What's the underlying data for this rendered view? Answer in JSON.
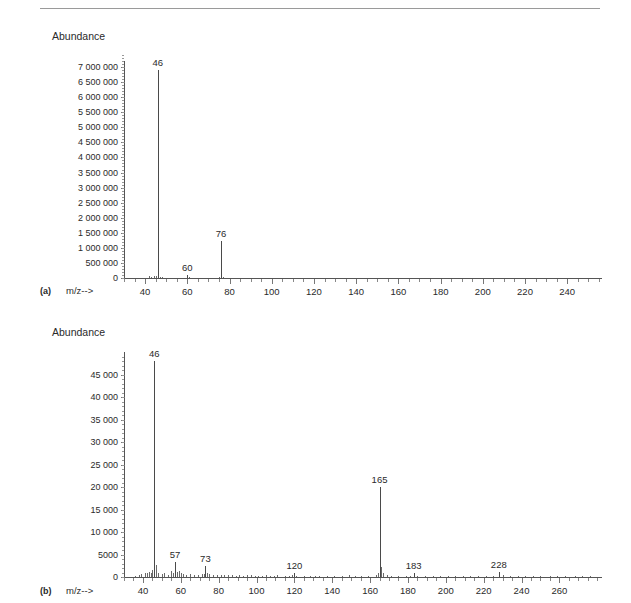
{
  "page": {
    "header_rule": true,
    "cropped_header_text": ""
  },
  "panels": [
    {
      "id": "a",
      "letter": "(a)",
      "y_axis_title": "Abundance",
      "x_axis_title": "m/z-->"
    },
    {
      "id": "b",
      "letter": "(b)",
      "y_axis_title": "Abundance",
      "x_axis_title": "m/z-->"
    }
  ],
  "chart_data": [
    {
      "type": "bar",
      "id": "spectrum-a",
      "title": "",
      "subtitle": "(a)",
      "xlabel": "m/z-->",
      "ylabel": "Abundance",
      "xlim": [
        30,
        256
      ],
      "ylim": [
        0,
        7200000
      ],
      "xticks": [
        40,
        60,
        80,
        100,
        120,
        140,
        160,
        180,
        200,
        220,
        240
      ],
      "xtick_minor_step": 5,
      "yticks": [
        0,
        500000,
        1000000,
        1500000,
        2000000,
        2500000,
        3000000,
        3500000,
        4000000,
        4500000,
        5000000,
        5500000,
        6000000,
        6500000,
        7000000
      ],
      "ytick_labels": [
        "0",
        "500 000",
        "1 000 000",
        "1 500 000",
        "2 000 000",
        "2 500 000",
        "3 000 000",
        "3 500 000",
        "4 000 000",
        "4 500 000",
        "5 000 000",
        "5 500 000",
        "6 000 000",
        "6 500 000",
        "7 000 000"
      ],
      "grid": false,
      "legend": "none",
      "labeled_peaks": [
        {
          "mz": 46,
          "intensity": 6900000,
          "label": "46"
        },
        {
          "mz": 60,
          "intensity": 90000,
          "label": "60"
        },
        {
          "mz": 76,
          "intensity": 1220000,
          "label": "76"
        }
      ],
      "minor_peaks": [
        {
          "mz": 42,
          "intensity": 55000
        },
        {
          "mz": 43,
          "intensity": 40000
        },
        {
          "mz": 44,
          "intensity": 60000
        },
        {
          "mz": 45,
          "intensity": 70000
        },
        {
          "mz": 47,
          "intensity": 45000
        },
        {
          "mz": 48,
          "intensity": 35000
        },
        {
          "mz": 61,
          "intensity": 25000
        },
        {
          "mz": 75,
          "intensity": 30000
        },
        {
          "mz": 77,
          "intensity": 25000
        }
      ]
    },
    {
      "type": "bar",
      "id": "spectrum-b",
      "title": "",
      "subtitle": "(b)",
      "xlabel": "m/z-->",
      "ylabel": "Abundance",
      "xlim": [
        30,
        282
      ],
      "ylim": [
        0,
        50000
      ],
      "xticks": [
        40,
        60,
        80,
        100,
        120,
        140,
        160,
        180,
        200,
        220,
        240,
        260
      ],
      "xtick_minor_step": 5,
      "yticks": [
        0,
        5000,
        10000,
        15000,
        20000,
        25000,
        30000,
        35000,
        40000,
        45000
      ],
      "ytick_labels": [
        "0",
        "5000",
        "10 000",
        "15 000",
        "20 000",
        "25 000",
        "30 000",
        "35 000",
        "40 000",
        "45 000"
      ],
      "grid": false,
      "legend": "none",
      "labeled_peaks": [
        {
          "mz": 46,
          "intensity": 48000,
          "label": "46"
        },
        {
          "mz": 57,
          "intensity": 3300,
          "label": "57"
        },
        {
          "mz": 73,
          "intensity": 2500,
          "label": "73"
        },
        {
          "mz": 120,
          "intensity": 900,
          "label": "120"
        },
        {
          "mz": 165,
          "intensity": 20000,
          "label": "165"
        },
        {
          "mz": 183,
          "intensity": 1000,
          "label": "183"
        },
        {
          "mz": 228,
          "intensity": 1100,
          "label": "228"
        }
      ],
      "minor_peaks": [
        {
          "mz": 36,
          "intensity": 300
        },
        {
          "mz": 38,
          "intensity": 400
        },
        {
          "mz": 39,
          "intensity": 700
        },
        {
          "mz": 41,
          "intensity": 900
        },
        {
          "mz": 42,
          "intensity": 800
        },
        {
          "mz": 43,
          "intensity": 1200
        },
        {
          "mz": 44,
          "intensity": 900
        },
        {
          "mz": 45,
          "intensity": 1500
        },
        {
          "mz": 47,
          "intensity": 2600
        },
        {
          "mz": 48,
          "intensity": 1000
        },
        {
          "mz": 50,
          "intensity": 600
        },
        {
          "mz": 51,
          "intensity": 900
        },
        {
          "mz": 53,
          "intensity": 500
        },
        {
          "mz": 55,
          "intensity": 1300
        },
        {
          "mz": 56,
          "intensity": 900
        },
        {
          "mz": 58,
          "intensity": 1100
        },
        {
          "mz": 59,
          "intensity": 1400
        },
        {
          "mz": 60,
          "intensity": 800
        },
        {
          "mz": 61,
          "intensity": 700
        },
        {
          "mz": 63,
          "intensity": 500
        },
        {
          "mz": 65,
          "intensity": 600
        },
        {
          "mz": 67,
          "intensity": 400
        },
        {
          "mz": 69,
          "intensity": 500
        },
        {
          "mz": 71,
          "intensity": 600
        },
        {
          "mz": 72,
          "intensity": 700
        },
        {
          "mz": 74,
          "intensity": 900
        },
        {
          "mz": 75,
          "intensity": 700
        },
        {
          "mz": 77,
          "intensity": 500
        },
        {
          "mz": 79,
          "intensity": 400
        },
        {
          "mz": 81,
          "intensity": 350
        },
        {
          "mz": 83,
          "intensity": 400
        },
        {
          "mz": 85,
          "intensity": 500
        },
        {
          "mz": 87,
          "intensity": 350
        },
        {
          "mz": 89,
          "intensity": 300
        },
        {
          "mz": 91,
          "intensity": 450
        },
        {
          "mz": 93,
          "intensity": 300
        },
        {
          "mz": 95,
          "intensity": 350
        },
        {
          "mz": 97,
          "intensity": 400
        },
        {
          "mz": 99,
          "intensity": 300
        },
        {
          "mz": 101,
          "intensity": 250
        },
        {
          "mz": 103,
          "intensity": 300
        },
        {
          "mz": 105,
          "intensity": 350
        },
        {
          "mz": 107,
          "intensity": 250
        },
        {
          "mz": 109,
          "intensity": 300
        },
        {
          "mz": 111,
          "intensity": 350
        },
        {
          "mz": 115,
          "intensity": 300
        },
        {
          "mz": 117,
          "intensity": 250
        },
        {
          "mz": 119,
          "intensity": 400
        },
        {
          "mz": 121,
          "intensity": 300
        },
        {
          "mz": 125,
          "intensity": 250
        },
        {
          "mz": 128,
          "intensity": 300
        },
        {
          "mz": 131,
          "intensity": 250
        },
        {
          "mz": 133,
          "intensity": 300
        },
        {
          "mz": 137,
          "intensity": 250
        },
        {
          "mz": 141,
          "intensity": 300
        },
        {
          "mz": 145,
          "intensity": 250
        },
        {
          "mz": 149,
          "intensity": 350
        },
        {
          "mz": 152,
          "intensity": 300
        },
        {
          "mz": 155,
          "intensity": 250
        },
        {
          "mz": 159,
          "intensity": 300
        },
        {
          "mz": 163,
          "intensity": 500
        },
        {
          "mz": 164,
          "intensity": 900
        },
        {
          "mz": 166,
          "intensity": 2200
        },
        {
          "mz": 167,
          "intensity": 800
        },
        {
          "mz": 169,
          "intensity": 400
        },
        {
          "mz": 171,
          "intensity": 300
        },
        {
          "mz": 175,
          "intensity": 300
        },
        {
          "mz": 179,
          "intensity": 250
        },
        {
          "mz": 181,
          "intensity": 300
        },
        {
          "mz": 185,
          "intensity": 300
        },
        {
          "mz": 189,
          "intensity": 250
        },
        {
          "mz": 193,
          "intensity": 300
        },
        {
          "mz": 197,
          "intensity": 250
        },
        {
          "mz": 201,
          "intensity": 300
        },
        {
          "mz": 205,
          "intensity": 250
        },
        {
          "mz": 209,
          "intensity": 300
        },
        {
          "mz": 213,
          "intensity": 250
        },
        {
          "mz": 217,
          "intensity": 300
        },
        {
          "mz": 221,
          "intensity": 250
        },
        {
          "mz": 225,
          "intensity": 300
        },
        {
          "mz": 230,
          "intensity": 350
        },
        {
          "mz": 234,
          "intensity": 250
        },
        {
          "mz": 238,
          "intensity": 300
        },
        {
          "mz": 242,
          "intensity": 250
        },
        {
          "mz": 246,
          "intensity": 300
        },
        {
          "mz": 250,
          "intensity": 250
        },
        {
          "mz": 255,
          "intensity": 300
        },
        {
          "mz": 259,
          "intensity": 250
        },
        {
          "mz": 263,
          "intensity": 300
        },
        {
          "mz": 268,
          "intensity": 250
        },
        {
          "mz": 272,
          "intensity": 300
        },
        {
          "mz": 276,
          "intensity": 250
        }
      ]
    }
  ]
}
